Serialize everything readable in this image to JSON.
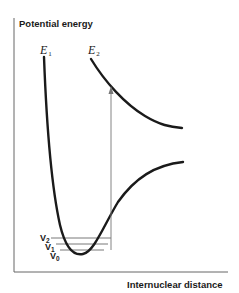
{
  "diagram": {
    "y_axis_label": "Potential energy",
    "x_axis_label": "Internuclear distance",
    "curves": [
      {
        "name": "E",
        "subscript": "1",
        "description": "ground state potential well"
      },
      {
        "name": "E",
        "subscript": "2",
        "description": "excited repulsive state"
      }
    ],
    "levels": [
      {
        "name": "V",
        "subscript": "2"
      },
      {
        "name": "V",
        "subscript": "1"
      },
      {
        "name": "V",
        "subscript": "0"
      }
    ],
    "transition": "vertical arrow from V0 level to E2 curve",
    "colors": {
      "curve": "#1a1a1a",
      "axis": "#555555",
      "arrow": "#777777"
    }
  }
}
